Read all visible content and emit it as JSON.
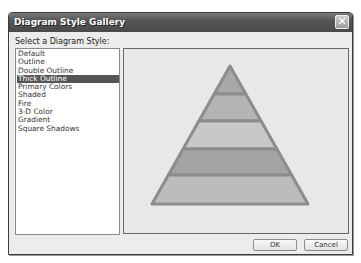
{
  "dialog": {
    "title": "Diagram Style Gallery",
    "close_icon": "close-icon",
    "select_label": "Select a Diagram Style:",
    "styles": [
      {
        "label": "Default",
        "selected": false
      },
      {
        "label": "Outline",
        "selected": false
      },
      {
        "label": "Double Outline",
        "selected": false
      },
      {
        "label": "Thick Outline",
        "selected": true
      },
      {
        "label": "Primary Colors",
        "selected": false
      },
      {
        "label": "Shaded",
        "selected": false
      },
      {
        "label": "Fire",
        "selected": false
      },
      {
        "label": "3-D Color",
        "selected": false
      },
      {
        "label": "Gradient",
        "selected": false
      },
      {
        "label": "Square Shadows",
        "selected": false
      }
    ],
    "preview": {
      "type": "pyramid",
      "layers": 5,
      "outline_color": "#8c8c8c",
      "layer_colors": [
        "#a8a8a8",
        "#b4b4b4",
        "#c8c8c8",
        "#a4a4a4",
        "#bcbcbc"
      ]
    },
    "buttons": {
      "ok": "OK",
      "cancel": "Cancel"
    }
  }
}
